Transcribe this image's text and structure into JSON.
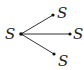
{
  "diagram": {
    "type": "star-tree",
    "root": {
      "label": "S",
      "x": 21,
      "y": 34
    },
    "children": [
      {
        "label": "S",
        "x": 53,
        "y": 15
      },
      {
        "label": "S",
        "x": 70,
        "y": 34
      },
      {
        "label": "S",
        "x": 54,
        "y": 54
      }
    ],
    "colors": {
      "line": "#333333",
      "node": "#111111",
      "text": "#222222"
    }
  }
}
